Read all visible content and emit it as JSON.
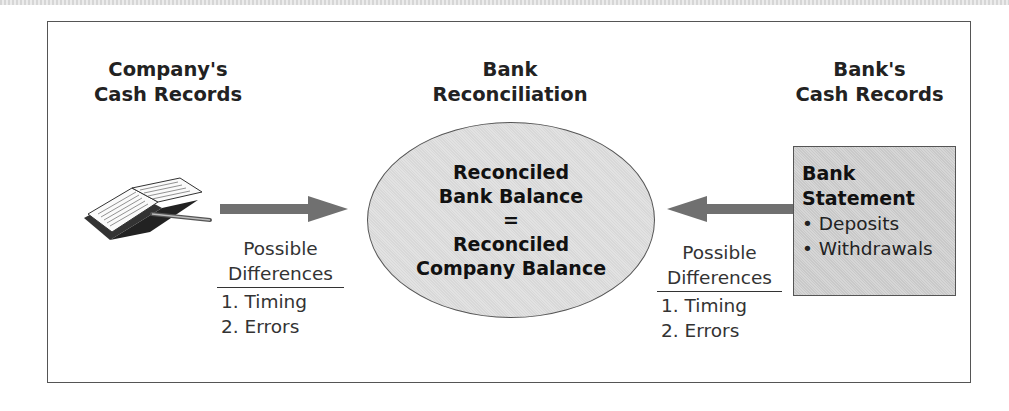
{
  "diagram": {
    "left": {
      "header": [
        "Company's",
        "Cash Records"
      ],
      "icon": "open-book-with-pen-icon",
      "differences": {
        "title_line1": "Possible",
        "title_line2": "Differences",
        "items": [
          "1. Timing",
          "2. Errors"
        ]
      }
    },
    "center": {
      "header": [
        "Bank",
        "Reconciliation"
      ],
      "oval_lines": [
        "Reconciled",
        "Bank Balance",
        "=",
        "Reconciled",
        "Company Balance"
      ]
    },
    "right": {
      "header": [
        "Bank's",
        "Cash Records"
      ],
      "statement_box": {
        "title": [
          "Bank",
          "Statement"
        ],
        "bullets": [
          "• Deposits",
          "• Withdrawals"
        ]
      },
      "differences": {
        "title_line1": "Possible",
        "title_line2": "Differences",
        "items": [
          "1. Timing",
          "2. Errors"
        ]
      }
    },
    "colors": {
      "arrow": "#707070",
      "oval_fill": "#dddddd",
      "statement_fill": "#cfcfcf",
      "border": "#555555"
    }
  }
}
